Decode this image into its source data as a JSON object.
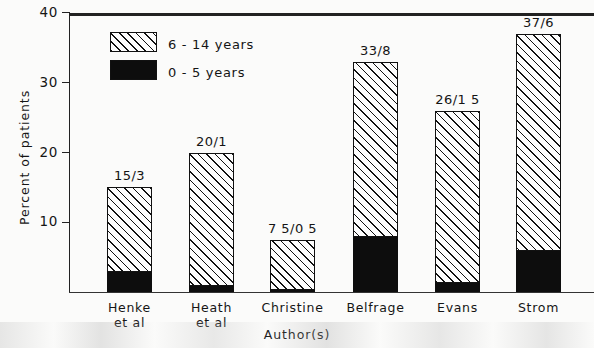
{
  "chart_data": {
    "type": "bar",
    "title": "",
    "subtitle": "",
    "xlabel": "Author(s)",
    "ylabel": "Percent of patients",
    "ylim": [
      0,
      40
    ],
    "yticks": [
      10,
      20,
      30,
      40
    ],
    "ytick_labels": [
      "10",
      "20",
      "30",
      "40"
    ],
    "grid": false,
    "stacked": true,
    "legend_position": "upper-left-inside",
    "categories": [
      "Henke\net al",
      "Heath\net al",
      "Christine",
      "Belfrage",
      "Evans",
      "Strom"
    ],
    "category_labels": [
      "Henke et al",
      "Heath et al",
      "Christine",
      "Belfrage",
      "Evans",
      "Strom"
    ],
    "series": [
      {
        "name": "0-5 years",
        "fill": "solid-black",
        "values": [
          3,
          1,
          0.5,
          8,
          1.5,
          6
        ]
      },
      {
        "name": "6-14 years",
        "fill": "diagonal-hatch",
        "values": [
          12,
          19,
          7,
          25,
          24.5,
          31
        ]
      }
    ],
    "bar_totals": [
      15,
      20,
      7.5,
      33,
      26,
      37
    ],
    "annotations": [
      "15/3",
      "20/1",
      "7 5/0 5",
      "33/8",
      "26/1 5",
      "37/6"
    ],
    "colors": {
      "solid": "#0d0d0d",
      "hatch_line": "#111111",
      "hatch_background": "#fdfdfd",
      "axis": "#222222",
      "text": "#151515",
      "page_background": "#fbfbfa"
    }
  },
  "legend": {
    "entries": [
      {
        "label": "6 - 14 years",
        "fill": "diagonal-hatch"
      },
      {
        "label": "0 - 5 years",
        "fill": "solid-black"
      }
    ]
  },
  "axes": {
    "y": {
      "title": "Percent of patients",
      "ticks": [
        {
          "label": "40",
          "value": 40
        },
        {
          "label": "30",
          "value": 30
        },
        {
          "label": "20",
          "value": 20
        },
        {
          "label": "10",
          "value": 10
        }
      ]
    },
    "x": {
      "title": "Author(s)"
    }
  }
}
